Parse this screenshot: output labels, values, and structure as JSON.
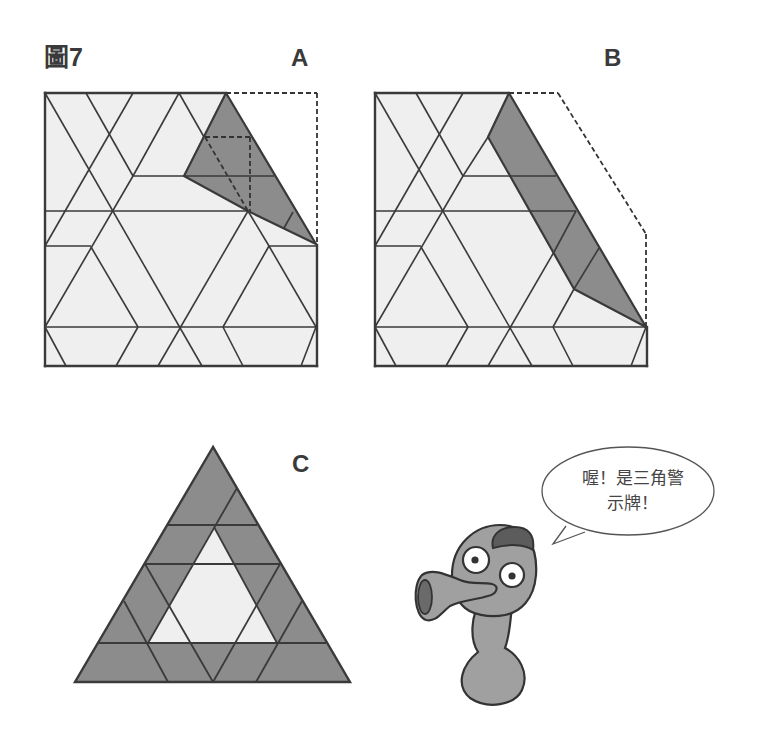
{
  "figure": {
    "title": "圖7",
    "colors": {
      "line": "#3a3a3a",
      "light_fill": "#efefef",
      "shaded_fill": "#8c8c8c",
      "dashed": "#333333",
      "background": "#ffffff"
    }
  },
  "panels": {
    "a": {
      "label": "A",
      "width": 272,
      "height": 273,
      "light_outline": [
        [
          0,
          0
        ],
        [
          181,
          0
        ],
        [
          271,
          151
        ],
        [
          272,
          151
        ],
        [
          272,
          273
        ],
        [
          0,
          273
        ]
      ],
      "grid_lines": [
        [
          [
            0,
            0
          ],
          [
            157,
            273
          ]
        ],
        [
          [
            41,
            0
          ],
          [
            88,
            83
          ]
        ],
        [
          [
            88,
            83
          ],
          [
            134,
            0
          ]
        ],
        [
          [
            134,
            0
          ],
          [
            159,
            44
          ]
        ],
        [
          [
            88,
            0
          ],
          [
            0,
            153
          ]
        ],
        [
          [
            88,
            83
          ],
          [
            0,
            234
          ]
        ],
        [
          [
            46,
            154
          ],
          [
            93,
            234
          ]
        ],
        [
          [
            0,
            153
          ],
          [
            46,
            153
          ]
        ],
        [
          [
            88,
            83
          ],
          [
            139,
            83
          ]
        ],
        [
          [
            0,
            118
          ],
          [
            203,
            118
          ]
        ],
        [
          [
            203,
            118
          ],
          [
            113,
            273
          ]
        ],
        [
          [
            203,
            118
          ],
          [
            224,
            153
          ]
        ],
        [
          [
            224,
            153
          ],
          [
            272,
            153
          ]
        ],
        [
          [
            224,
            153
          ],
          [
            178,
            234
          ]
        ],
        [
          [
            224,
            153
          ],
          [
            271,
            234
          ]
        ],
        [
          [
            0,
            234
          ],
          [
            272,
            234
          ]
        ],
        [
          [
            0,
            234
          ],
          [
            21,
            273
          ]
        ],
        [
          [
            93,
            234
          ],
          [
            71,
            273
          ]
        ],
        [
          [
            178,
            234
          ],
          [
            198,
            273
          ]
        ],
        [
          [
            271,
            234
          ],
          [
            256,
            273
          ]
        ]
      ],
      "shaded_polygon": [
        [
          181,
          0
        ],
        [
          271,
          151
        ],
        [
          203,
          118
        ],
        [
          139,
          83
        ]
      ],
      "shaded_lines": [
        [
          [
            139,
            83
          ],
          [
            229,
            83
          ]
        ],
        [
          [
            248,
            119
          ],
          [
            239,
            135
          ]
        ]
      ],
      "dashed_lines": [
        [
          [
            181,
            0
          ],
          [
            272,
            0
          ]
        ],
        [
          [
            272,
            0
          ],
          [
            272,
            152
          ]
        ],
        [
          [
            160,
            44
          ],
          [
            205,
            44
          ]
        ],
        [
          [
            205,
            44
          ],
          [
            205,
            118
          ]
        ],
        [
          [
            160,
            44
          ],
          [
            203,
            118
          ]
        ]
      ],
      "outer_lines": [
        [
          [
            0,
            0
          ],
          [
            181,
            0
          ]
        ],
        [
          [
            0,
            0
          ],
          [
            0,
            273
          ]
        ],
        [
          [
            0,
            273
          ],
          [
            272,
            273
          ]
        ],
        [
          [
            272,
            152
          ],
          [
            272,
            273
          ]
        ]
      ]
    },
    "b": {
      "label": "B",
      "width": 272,
      "height": 273,
      "light_outline": [
        [
          0,
          0
        ],
        [
          134,
          0
        ],
        [
          271,
          234
        ],
        [
          272,
          234
        ],
        [
          272,
          273
        ],
        [
          0,
          273
        ]
      ],
      "grid_lines": [
        [
          [
            0,
            0
          ],
          [
            157,
            273
          ]
        ],
        [
          [
            41,
            0
          ],
          [
            88,
            83
          ]
        ],
        [
          [
            88,
            83
          ],
          [
            113,
            44
          ]
        ],
        [
          [
            88,
            0
          ],
          [
            0,
            153
          ]
        ],
        [
          [
            88,
            83
          ],
          [
            0,
            234
          ]
        ],
        [
          [
            46,
            154
          ],
          [
            93,
            234
          ]
        ],
        [
          [
            0,
            153
          ],
          [
            46,
            153
          ]
        ],
        [
          [
            88,
            83
          ],
          [
            135,
            83
          ]
        ],
        [
          [
            0,
            118
          ],
          [
            154,
            118
          ]
        ],
        [
          [
            179,
            159
          ],
          [
            113,
            273
          ]
        ],
        [
          [
            199,
            196
          ],
          [
            178,
            234
          ]
        ],
        [
          [
            0,
            234
          ],
          [
            272,
            234
          ]
        ],
        [
          [
            0,
            234
          ],
          [
            21,
            273
          ]
        ],
        [
          [
            93,
            234
          ],
          [
            71,
            273
          ]
        ],
        [
          [
            178,
            234
          ],
          [
            198,
            273
          ]
        ],
        [
          [
            271,
            234
          ],
          [
            256,
            273
          ]
        ]
      ],
      "shaded_polygon": [
        [
          134,
          0
        ],
        [
          271,
          234
        ],
        [
          199,
          196
        ],
        [
          113,
          44
        ]
      ],
      "shaded_lines": [
        [
          [
            135,
            83
          ],
          [
            181,
            83
          ]
        ],
        [
          [
            154,
            118
          ],
          [
            201,
            118
          ]
        ],
        [
          [
            201,
            118
          ],
          [
            179,
            159
          ]
        ],
        [
          [
            224,
            155
          ],
          [
            199,
            196
          ]
        ]
      ],
      "dashed_lines": [
        [
          [
            134,
            0
          ],
          [
            183,
            0
          ]
        ],
        [
          [
            183,
            0
          ],
          [
            271,
            141
          ]
        ],
        [
          [
            271,
            141
          ],
          [
            271,
            234
          ]
        ]
      ],
      "outer_lines": [
        [
          [
            0,
            0
          ],
          [
            134,
            0
          ]
        ],
        [
          [
            0,
            0
          ],
          [
            0,
            273
          ]
        ],
        [
          [
            0,
            273
          ],
          [
            272,
            273
          ]
        ],
        [
          [
            272,
            234
          ],
          [
            272,
            273
          ]
        ]
      ]
    },
    "c": {
      "label": "C",
      "outer_triangle": [
        [
          213,
          447
        ],
        [
          75,
          682
        ],
        [
          350,
          682
        ]
      ],
      "white_triangle": [
        [
          214,
          527
        ],
        [
          149,
          643
        ],
        [
          277,
          643
        ]
      ],
      "lines": [
        [
          [
            167,
            525
          ],
          [
            257,
            525
          ]
        ],
        [
          [
            145,
            564
          ],
          [
            280,
            564
          ]
        ],
        [
          [
            99,
            643
          ],
          [
            326,
            643
          ]
        ],
        [
          [
            237,
            488
          ],
          [
            148,
            643
          ]
        ],
        [
          [
            214,
            527
          ],
          [
            277,
            643
          ]
        ],
        [
          [
            145,
            564
          ],
          [
            213,
            682
          ]
        ],
        [
          [
            280,
            564
          ],
          [
            213,
            682
          ]
        ],
        [
          [
            124,
            601
          ],
          [
            168,
            682
          ]
        ],
        [
          [
            302,
            601
          ],
          [
            256,
            682
          ]
        ]
      ]
    }
  },
  "speech_bubble": {
    "lines": [
      "喔！是三角警",
      "示牌！"
    ],
    "cx": 628,
    "cy": 491,
    "rx": 86,
    "ry": 44,
    "tail": [
      [
        566,
        526
      ],
      [
        553,
        544
      ],
      [
        585,
        532
      ]
    ]
  },
  "character": {
    "name": "cartoon-creature-with-horn",
    "body_fill": "#a0a0a0",
    "hair_fill": "#5c5c5c",
    "horn_inner_fill": "#6a6a6a",
    "eye_white": "#ffffff",
    "pupil": "#333333"
  }
}
